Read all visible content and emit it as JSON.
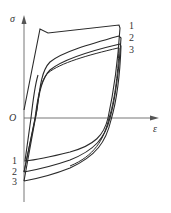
{
  "diagram": {
    "type": "stress-strain hysteresis loops",
    "axes": {
      "y_label": "σ",
      "x_label": "ε",
      "origin_label": "O"
    },
    "curves": [
      {
        "id": "1",
        "top_label": "1",
        "bottom_label": "1"
      },
      {
        "id": "2",
        "top_label": "2",
        "bottom_label": "2"
      },
      {
        "id": "3",
        "top_label": "3",
        "bottom_label": "3"
      }
    ],
    "colors": {
      "line": "#2a2a2a",
      "axis": "#555555",
      "background": "#ffffff"
    }
  }
}
